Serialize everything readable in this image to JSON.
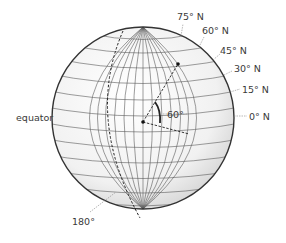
{
  "diagram": {
    "labels": {
      "lat75": "75° N",
      "lat60": "60° N",
      "lat45": "45° N",
      "lat30": "30° N",
      "lat15": "15° N",
      "lat0": "0° N",
      "equator": "equator",
      "angle": "60°",
      "meridian180": "180°"
    },
    "colors": {
      "outline": "#333333",
      "grid": "#5a5a5a",
      "fill": "#f4f4f4",
      "text": "#3a3a3a"
    }
  }
}
